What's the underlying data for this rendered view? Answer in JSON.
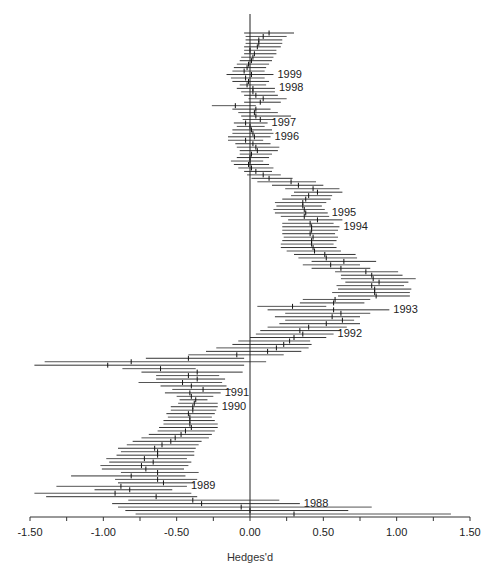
{
  "chart_data": {
    "type": "forest",
    "title": "",
    "xlabel": "Hedges'd",
    "ylabel": "",
    "xlim": [
      -1.5,
      1.5
    ],
    "x_ticks": [
      -1.5,
      -1.25,
      -1.0,
      -0.75,
      -0.5,
      -0.25,
      0.0,
      0.25,
      0.5,
      0.75,
      1.0,
      1.25,
      1.5
    ],
    "x_tick_labels": [
      "-1.50",
      "-1.00",
      "-0.50",
      "0.00",
      "0.50",
      "1.00",
      "1.50"
    ],
    "x_tick_label_values": [
      -1.5,
      -1.0,
      -0.5,
      0.0,
      0.5,
      1.0,
      1.5
    ],
    "reference_line": 0.0,
    "grid": false,
    "legend": null,
    "year_labels": [
      {
        "label": "1999",
        "row": 12
      },
      {
        "label": "1998",
        "row": 16
      },
      {
        "label": "1997",
        "row": 26
      },
      {
        "label": "1996",
        "row": 30
      },
      {
        "label": "1995",
        "row": 52
      },
      {
        "label": "1994",
        "row": 56
      },
      {
        "label": "1993",
        "row": 80
      },
      {
        "label": "1992",
        "row": 87
      },
      {
        "label": "1991",
        "row": 104
      },
      {
        "label": "1990",
        "row": 108
      },
      {
        "label": "1989",
        "row": 131
      },
      {
        "label": "1988",
        "row": 136
      },
      {
        "label": "1987",
        "row": 140
      },
      {
        "label": "1983",
        "row": 144
      }
    ],
    "series": [
      {
        "name": "cumulative effect size",
        "rows": [
          {
            "est": 0.13,
            "lo": -0.04,
            "hi": 0.3
          },
          {
            "est": 0.09,
            "lo": -0.03,
            "hi": 0.25
          },
          {
            "est": 0.06,
            "lo": -0.03,
            "hi": 0.22
          },
          {
            "est": 0.06,
            "lo": -0.03,
            "hi": 0.22
          },
          {
            "est": 0.05,
            "lo": -0.04,
            "hi": 0.21
          },
          {
            "est": 0.0,
            "lo": -0.04,
            "hi": 0.18
          },
          {
            "est": 0.03,
            "lo": -0.04,
            "hi": 0.18
          },
          {
            "est": 0.02,
            "lo": -0.06,
            "hi": 0.16
          },
          {
            "est": 0.01,
            "lo": -0.07,
            "hi": 0.15
          },
          {
            "est": -0.01,
            "lo": -0.09,
            "hi": 0.13
          },
          {
            "est": -0.02,
            "lo": -0.11,
            "hi": 0.11
          },
          {
            "est": -0.04,
            "lo": -0.12,
            "hi": 0.1
          },
          {
            "est": 0.01,
            "lo": -0.16,
            "hi": 0.16
          },
          {
            "est": -0.03,
            "lo": -0.13,
            "hi": 0.1
          },
          {
            "est": -0.01,
            "lo": -0.12,
            "hi": 0.13
          },
          {
            "est": -0.02,
            "lo": -0.07,
            "hi": 0.11
          },
          {
            "est": 0.02,
            "lo": -0.09,
            "hi": 0.17
          },
          {
            "est": 0.02,
            "lo": -0.06,
            "hi": 0.17
          },
          {
            "est": 0.04,
            "lo": -0.04,
            "hi": 0.19
          },
          {
            "est": 0.09,
            "lo": -0.01,
            "hi": 0.25
          },
          {
            "est": 0.07,
            "lo": -0.04,
            "hi": 0.21
          },
          {
            "est": -0.1,
            "lo": -0.26,
            "hi": 0.04
          },
          {
            "est": 0.04,
            "lo": -0.12,
            "hi": 0.14
          },
          {
            "est": 0.03,
            "lo": -0.08,
            "hi": 0.19
          },
          {
            "est": 0.04,
            "lo": -0.06,
            "hi": 0.28
          },
          {
            "est": 0.07,
            "lo": -0.05,
            "hi": 0.17
          },
          {
            "est": -0.03,
            "lo": -0.11,
            "hi": 0.12
          },
          {
            "est": 0.0,
            "lo": -0.09,
            "hi": 0.1
          },
          {
            "est": 0.01,
            "lo": -0.12,
            "hi": 0.15
          },
          {
            "est": 0.02,
            "lo": -0.12,
            "hi": 0.16
          },
          {
            "est": 0.03,
            "lo": -0.15,
            "hi": 0.14
          },
          {
            "est": -0.03,
            "lo": -0.15,
            "hi": 0.09
          },
          {
            "est": 0.02,
            "lo": -0.1,
            "hi": 0.14
          },
          {
            "est": 0.04,
            "lo": -0.09,
            "hi": 0.2
          },
          {
            "est": 0.05,
            "lo": -0.07,
            "hi": 0.19
          },
          {
            "est": 0.01,
            "lo": -0.07,
            "hi": 0.15
          },
          {
            "est": 0.0,
            "lo": -0.09,
            "hi": 0.13
          },
          {
            "est": 0.0,
            "lo": -0.13,
            "hi": 0.09
          },
          {
            "est": -0.01,
            "lo": -0.11,
            "hi": 0.13
          },
          {
            "est": 0.01,
            "lo": -0.08,
            "hi": 0.16
          },
          {
            "est": 0.04,
            "lo": -0.04,
            "hi": 0.15
          },
          {
            "est": 0.09,
            "lo": -0.02,
            "hi": 0.21
          },
          {
            "est": 0.13,
            "lo": 0.01,
            "hi": 0.29
          },
          {
            "est": 0.28,
            "lo": 0.05,
            "hi": 0.45
          },
          {
            "est": 0.33,
            "lo": 0.15,
            "hi": 0.5
          },
          {
            "est": 0.43,
            "lo": 0.24,
            "hi": 0.61
          },
          {
            "est": 0.46,
            "lo": 0.3,
            "hi": 0.63
          },
          {
            "est": 0.4,
            "lo": 0.28,
            "hi": 0.56
          },
          {
            "est": 0.38,
            "lo": 0.22,
            "hi": 0.55
          },
          {
            "est": 0.36,
            "lo": 0.17,
            "hi": 0.52
          },
          {
            "est": 0.36,
            "lo": 0.18,
            "hi": 0.49
          },
          {
            "est": 0.37,
            "lo": 0.16,
            "hi": 0.51
          },
          {
            "est": 0.38,
            "lo": 0.17,
            "hi": 0.53
          },
          {
            "est": 0.37,
            "lo": 0.21,
            "hi": 0.54
          },
          {
            "est": 0.46,
            "lo": 0.26,
            "hi": 0.63
          },
          {
            "est": 0.41,
            "lo": 0.22,
            "hi": 0.57
          },
          {
            "est": 0.42,
            "lo": 0.22,
            "hi": 0.61
          },
          {
            "est": 0.42,
            "lo": 0.22,
            "hi": 0.6
          },
          {
            "est": 0.41,
            "lo": 0.22,
            "hi": 0.58
          },
          {
            "est": 0.43,
            "lo": 0.23,
            "hi": 0.6
          },
          {
            "est": 0.42,
            "lo": 0.22,
            "hi": 0.59
          },
          {
            "est": 0.42,
            "lo": 0.21,
            "hi": 0.57
          },
          {
            "est": 0.43,
            "lo": 0.21,
            "hi": 0.59
          },
          {
            "est": 0.44,
            "lo": 0.25,
            "hi": 0.62
          },
          {
            "est": 0.51,
            "lo": 0.3,
            "hi": 0.72
          },
          {
            "est": 0.52,
            "lo": 0.33,
            "hi": 0.73
          },
          {
            "est": 0.64,
            "lo": 0.42,
            "hi": 0.86
          },
          {
            "est": 0.55,
            "lo": 0.36,
            "hi": 0.75
          },
          {
            "est": 0.62,
            "lo": 0.42,
            "hi": 0.82
          },
          {
            "est": 0.79,
            "lo": 0.58,
            "hi": 1.01
          },
          {
            "est": 0.83,
            "lo": 0.62,
            "hi": 1.04
          },
          {
            "est": 0.84,
            "lo": 0.62,
            "hi": 1.13
          },
          {
            "est": 0.88,
            "lo": 0.65,
            "hi": 1.08
          },
          {
            "est": 0.83,
            "lo": 0.59,
            "hi": 1.05
          },
          {
            "est": 0.85,
            "lo": 0.6,
            "hi": 1.1
          },
          {
            "est": 0.85,
            "lo": 0.56,
            "hi": 1.09
          },
          {
            "est": 0.86,
            "lo": 0.6,
            "hi": 1.09
          },
          {
            "est": 0.58,
            "lo": 0.36,
            "hi": 0.82
          },
          {
            "est": 0.57,
            "lo": 0.34,
            "hi": 0.78
          },
          {
            "est": 0.29,
            "lo": 0.05,
            "hi": 0.52
          },
          {
            "est": 0.57,
            "lo": 0.12,
            "hi": 0.95
          },
          {
            "est": 0.62,
            "lo": 0.24,
            "hi": 0.82
          },
          {
            "est": 0.56,
            "lo": 0.17,
            "hi": 0.75
          },
          {
            "est": 0.63,
            "lo": 0.24,
            "hi": 0.71
          },
          {
            "est": 0.52,
            "lo": 0.2,
            "hi": 0.75
          },
          {
            "est": 0.4,
            "lo": 0.12,
            "hi": 0.66
          },
          {
            "est": 0.34,
            "lo": 0.07,
            "hi": 0.62
          },
          {
            "est": 0.36,
            "lo": 0.04,
            "hi": 0.57
          },
          {
            "est": 0.3,
            "lo": 0.0,
            "hi": 0.52
          },
          {
            "est": 0.27,
            "lo": -0.08,
            "hi": 0.41
          },
          {
            "est": 0.23,
            "lo": -0.12,
            "hi": 0.42
          },
          {
            "est": 0.18,
            "lo": -0.23,
            "hi": 0.4
          },
          {
            "est": 0.12,
            "lo": -0.3,
            "hi": 0.35
          },
          {
            "est": -0.09,
            "lo": -0.42,
            "hi": 0.23
          },
          {
            "est": -0.42,
            "lo": -0.71,
            "hi": -0.04
          },
          {
            "est": -0.81,
            "lo": -1.4,
            "hi": 0.11
          },
          {
            "est": -0.97,
            "lo": -1.47,
            "hi": -0.04
          },
          {
            "est": -0.61,
            "lo": -0.87,
            "hi": -0.37
          },
          {
            "est": -0.36,
            "lo": -0.74,
            "hi": -0.05
          },
          {
            "est": -0.42,
            "lo": -0.64,
            "hi": -0.21
          },
          {
            "est": -0.36,
            "lo": -0.64,
            "hi": -0.17
          },
          {
            "est": -0.46,
            "lo": -0.76,
            "hi": -0.19
          },
          {
            "est": -0.4,
            "lo": -0.61,
            "hi": -0.16
          },
          {
            "est": -0.32,
            "lo": -0.53,
            "hi": -0.13
          },
          {
            "est": -0.41,
            "lo": -0.58,
            "hi": -0.2
          },
          {
            "est": -0.4,
            "lo": -0.5,
            "hi": -0.25
          },
          {
            "est": -0.37,
            "lo": -0.48,
            "hi": -0.29
          },
          {
            "est": -0.38,
            "lo": -0.49,
            "hi": -0.22
          },
          {
            "est": -0.39,
            "lo": -0.54,
            "hi": -0.22
          },
          {
            "est": -0.39,
            "lo": -0.54,
            "hi": -0.23
          },
          {
            "est": -0.42,
            "lo": -0.57,
            "hi": -0.24
          },
          {
            "est": -0.41,
            "lo": -0.56,
            "hi": -0.26
          },
          {
            "est": -0.41,
            "lo": -0.59,
            "hi": -0.24
          },
          {
            "est": -0.41,
            "lo": -0.59,
            "hi": -0.22
          },
          {
            "est": -0.4,
            "lo": -0.62,
            "hi": -0.22
          },
          {
            "est": -0.44,
            "lo": -0.63,
            "hi": -0.24
          },
          {
            "est": -0.47,
            "lo": -0.69,
            "hi": -0.26
          },
          {
            "est": -0.51,
            "lo": -0.74,
            "hi": -0.28
          },
          {
            "est": -0.54,
            "lo": -0.8,
            "hi": -0.33
          },
          {
            "est": -0.6,
            "lo": -0.84,
            "hi": -0.35
          },
          {
            "est": -0.65,
            "lo": -0.9,
            "hi": -0.37
          },
          {
            "est": -0.63,
            "lo": -0.88,
            "hi": -0.38
          },
          {
            "est": -0.63,
            "lo": -0.91,
            "hi": -0.38
          },
          {
            "est": -0.72,
            "lo": -0.98,
            "hi": -0.43
          },
          {
            "est": -0.66,
            "lo": -0.96,
            "hi": -0.4
          },
          {
            "est": -0.74,
            "lo": -1.02,
            "hi": -0.42
          },
          {
            "est": -0.71,
            "lo": -1.01,
            "hi": -0.45
          },
          {
            "est": -0.63,
            "lo": -0.88,
            "hi": -0.35
          },
          {
            "est": -0.81,
            "lo": -1.22,
            "hi": -0.44
          },
          {
            "est": -0.63,
            "lo": -0.92,
            "hi": -0.36
          },
          {
            "est": -0.59,
            "lo": -0.9,
            "hi": -0.38
          },
          {
            "est": -0.88,
            "lo": -1.32,
            "hi": -0.43
          },
          {
            "est": -0.82,
            "lo": -1.06,
            "hi": -0.53
          },
          {
            "est": -0.92,
            "lo": -1.47,
            "hi": -0.4
          },
          {
            "est": -0.64,
            "lo": -1.39,
            "hi": -0.36
          },
          {
            "est": -0.39,
            "lo": -0.83,
            "hi": 0.2
          },
          {
            "est": -0.33,
            "lo": -0.94,
            "hi": 0.34
          },
          {
            "est": -0.06,
            "lo": -0.9,
            "hi": 0.83
          },
          {
            "est": 0.0,
            "lo": -0.85,
            "hi": 0.67
          },
          {
            "est": 0.3,
            "lo": -0.78,
            "hi": 1.37
          }
        ]
      }
    ]
  }
}
